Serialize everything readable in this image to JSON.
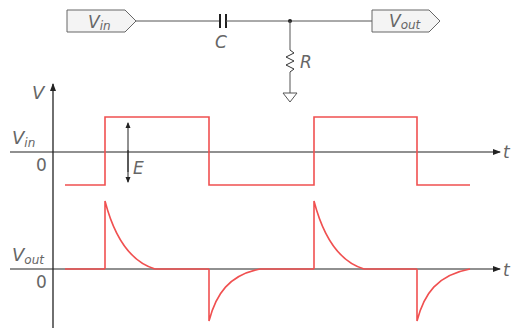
{
  "circuit": {
    "input_tag": {
      "main": "V",
      "sub": "in"
    },
    "output_tag": {
      "main": "V",
      "sub": "out"
    },
    "capacitor_label": "C",
    "resistor_label": "R"
  },
  "graphs": {
    "y_axis_label": "V",
    "x_axis_label": "t",
    "input_graph": {
      "signal_label": {
        "main": "V",
        "sub": "in"
      },
      "zero_label": "0",
      "amplitude_label": "E"
    },
    "output_graph": {
      "signal_label": {
        "main": "V",
        "sub": "out"
      },
      "zero_label": "0"
    }
  },
  "colors": {
    "signal": "#f05050",
    "axis": "#222222",
    "wire": "#555555",
    "text": "#666666"
  }
}
